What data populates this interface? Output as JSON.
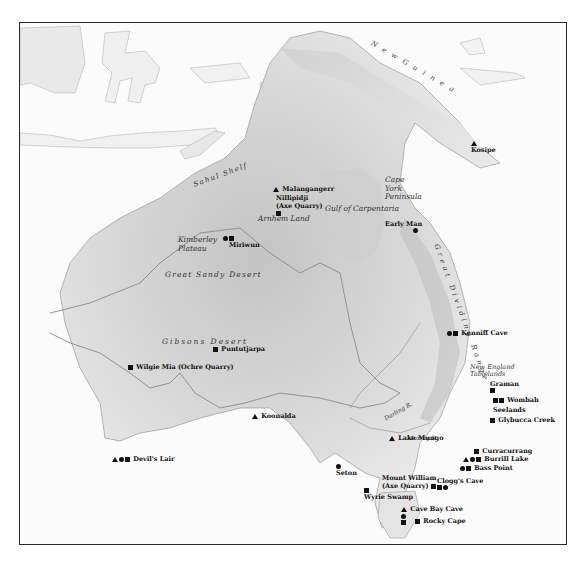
{
  "map": {
    "title": "Prehistoric archaeological sites of Sahul (Australia and New Guinea)",
    "colors": {
      "land_light": "#e6e6e6",
      "land_dark": "#bdbdbd",
      "shelf": "#d2d2d2",
      "sea": "#fbfbfb",
      "river": "#8a8a8a",
      "border": "#2a2a2a",
      "marker": "#111111"
    },
    "regions": [
      {
        "id": "new-guinea",
        "label": "N e w   G u i n e a"
      },
      {
        "id": "sahul-shelf",
        "label": "Sahul Shelf"
      },
      {
        "id": "arnhem-land",
        "label": "Arnhem Land"
      },
      {
        "id": "gulf-of-carpentaria",
        "label": "Gulf of Carpentaria"
      },
      {
        "id": "cape-york",
        "label": "Cape York Peninsula"
      },
      {
        "id": "kimberley",
        "label": "Kimberley Plateau"
      },
      {
        "id": "great-sandy-desert",
        "label": "Great Sandy Desert"
      },
      {
        "id": "gibsons-desert",
        "label": "Gibsons Desert"
      },
      {
        "id": "great-dividing-range",
        "label": "Great Dividing Range"
      },
      {
        "id": "new-england",
        "label": "New England Tablelands"
      },
      {
        "id": "darling-river",
        "label": "Darling R."
      },
      {
        "id": "murray-river",
        "label": "Murray R."
      }
    ],
    "sites": [
      {
        "name": "Kosipe",
        "symbols": [
          "triangle"
        ]
      },
      {
        "name": "Malangangerr",
        "symbols": [
          "triangle"
        ]
      },
      {
        "name": "Nillipidji (Axe Quarry)",
        "symbols": [
          "square"
        ]
      },
      {
        "name": "Early Man",
        "symbols": [
          "circle"
        ]
      },
      {
        "name": "Miriwun",
        "symbols": [
          "circle",
          "square"
        ]
      },
      {
        "name": "Kenniff Cave",
        "symbols": [
          "circle",
          "square"
        ]
      },
      {
        "name": "Puntutjarpa",
        "symbols": [
          "square"
        ]
      },
      {
        "name": "Wilgie Mia (Ochre Quarry)",
        "symbols": [
          "square"
        ]
      },
      {
        "name": "Graman",
        "symbols": [
          "square"
        ]
      },
      {
        "name": "Wombah",
        "symbols": [
          "square",
          "square"
        ]
      },
      {
        "name": "Seelands",
        "symbols": []
      },
      {
        "name": "Glybucca Creek",
        "symbols": [
          "square"
        ]
      },
      {
        "name": "Koonalda",
        "symbols": [
          "triangle"
        ]
      },
      {
        "name": "Lake Mungo",
        "symbols": [
          "triangle"
        ]
      },
      {
        "name": "Curracurrang",
        "symbols": [
          "square"
        ]
      },
      {
        "name": "Burrill Lake",
        "symbols": [
          "triangle",
          "circle",
          "square"
        ]
      },
      {
        "name": "Bass Point",
        "symbols": [
          "circle",
          "square"
        ]
      },
      {
        "name": "Devil's Lair",
        "symbols": [
          "triangle",
          "circle",
          "square"
        ]
      },
      {
        "name": "Seton",
        "symbols": [
          "circle"
        ]
      },
      {
        "name": "Mount William (Axe Quarry)",
        "symbols": [
          "square"
        ]
      },
      {
        "name": "Clogg's Cave",
        "symbols": [
          "square",
          "circle"
        ]
      },
      {
        "name": "Wyrie Swamp",
        "symbols": [
          "square"
        ]
      },
      {
        "name": "Cave Bay Cave",
        "symbols": [
          "triangle",
          "circle",
          "square"
        ]
      },
      {
        "name": "Rocky Cape",
        "symbols": [
          "square"
        ]
      }
    ]
  }
}
